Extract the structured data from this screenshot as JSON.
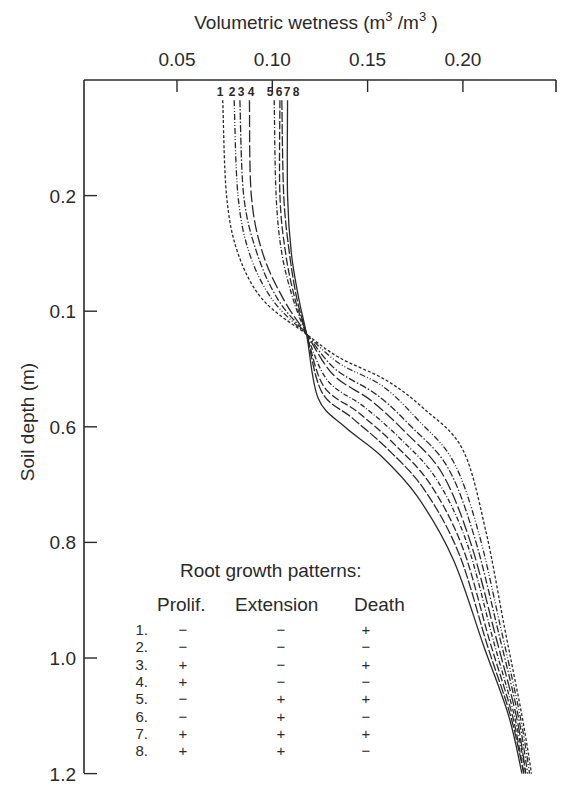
{
  "chart_data": {
    "type": "line",
    "title": "",
    "xlabel": "Volumetric wetness (m³/m³)",
    "ylabel": "Soil depth (m)",
    "x_axis_position": "top",
    "xlim": [
      0.0,
      0.25
    ],
    "ylim": [
      0.0,
      1.2
    ],
    "y_inverted": true,
    "grid": false,
    "x_ticks": [
      0.05,
      0.1,
      0.15,
      0.2
    ],
    "x_tick_labels": [
      "0.05",
      "0.10",
      "0.15",
      "0.20"
    ],
    "y_ticks": [
      0.2,
      0.4,
      0.6,
      0.8,
      1.0,
      1.2
    ],
    "y_tick_labels": [
      "0.2",
      "0.1",
      "0.6",
      "0.8",
      "1.0",
      "1.2"
    ],
    "series": [
      {
        "name": "1",
        "style": "dotted-dash",
        "points": [
          [
            0.074,
            0.035
          ],
          [
            0.076,
            0.2
          ],
          [
            0.082,
            0.3
          ],
          [
            0.095,
            0.38
          ],
          [
            0.118,
            0.44
          ],
          [
            0.135,
            0.48
          ],
          [
            0.16,
            0.52
          ],
          [
            0.18,
            0.57
          ],
          [
            0.2,
            0.64
          ],
          [
            0.212,
            0.78
          ],
          [
            0.222,
            0.95
          ],
          [
            0.231,
            1.1
          ],
          [
            0.236,
            1.2
          ]
        ]
      },
      {
        "name": "2",
        "style": "dash-dot-dot",
        "points": [
          [
            0.08,
            0.035
          ],
          [
            0.082,
            0.2
          ],
          [
            0.088,
            0.3
          ],
          [
            0.1,
            0.38
          ],
          [
            0.118,
            0.44
          ],
          [
            0.135,
            0.49
          ],
          [
            0.158,
            0.53
          ],
          [
            0.177,
            0.59
          ],
          [
            0.195,
            0.66
          ],
          [
            0.208,
            0.78
          ],
          [
            0.22,
            0.95
          ],
          [
            0.23,
            1.1
          ],
          [
            0.235,
            1.2
          ]
        ]
      },
      {
        "name": "3",
        "style": "dash-dot",
        "points": [
          [
            0.083,
            0.035
          ],
          [
            0.085,
            0.2
          ],
          [
            0.092,
            0.3
          ],
          [
            0.103,
            0.38
          ],
          [
            0.118,
            0.44
          ],
          [
            0.133,
            0.5
          ],
          [
            0.155,
            0.545
          ],
          [
            0.173,
            0.6
          ],
          [
            0.192,
            0.67
          ],
          [
            0.206,
            0.79
          ],
          [
            0.219,
            0.96
          ],
          [
            0.229,
            1.1
          ],
          [
            0.234,
            1.2
          ]
        ]
      },
      {
        "name": "4",
        "style": "long-dash",
        "points": [
          [
            0.088,
            0.035
          ],
          [
            0.089,
            0.2
          ],
          [
            0.095,
            0.3
          ],
          [
            0.106,
            0.38
          ],
          [
            0.118,
            0.44
          ],
          [
            0.132,
            0.51
          ],
          [
            0.152,
            0.555
          ],
          [
            0.17,
            0.61
          ],
          [
            0.189,
            0.68
          ],
          [
            0.204,
            0.8
          ],
          [
            0.217,
            0.96
          ],
          [
            0.228,
            1.1
          ],
          [
            0.233,
            1.2
          ]
        ]
      },
      {
        "name": "5",
        "style": "dash-dot-fine",
        "points": [
          [
            0.101,
            0.035
          ],
          [
            0.102,
            0.2
          ],
          [
            0.105,
            0.3
          ],
          [
            0.111,
            0.38
          ],
          [
            0.118,
            0.44
          ],
          [
            0.129,
            0.52
          ],
          [
            0.148,
            0.565
          ],
          [
            0.167,
            0.62
          ],
          [
            0.186,
            0.69
          ],
          [
            0.202,
            0.8
          ],
          [
            0.216,
            0.97
          ],
          [
            0.227,
            1.1
          ],
          [
            0.233,
            1.2
          ]
        ]
      },
      {
        "name": "6",
        "style": "medium-dash",
        "points": [
          [
            0.104,
            0.035
          ],
          [
            0.104,
            0.2
          ],
          [
            0.107,
            0.3
          ],
          [
            0.112,
            0.38
          ],
          [
            0.118,
            0.44
          ],
          [
            0.127,
            0.53
          ],
          [
            0.145,
            0.575
          ],
          [
            0.164,
            0.63
          ],
          [
            0.183,
            0.7
          ],
          [
            0.2,
            0.81
          ],
          [
            0.214,
            0.97
          ],
          [
            0.226,
            1.1
          ],
          [
            0.232,
            1.2
          ]
        ]
      },
      {
        "name": "7",
        "style": "dash-space",
        "points": [
          [
            0.105,
            0.035
          ],
          [
            0.106,
            0.2
          ],
          [
            0.109,
            0.3
          ],
          [
            0.113,
            0.38
          ],
          [
            0.118,
            0.44
          ],
          [
            0.126,
            0.54
          ],
          [
            0.142,
            0.585
          ],
          [
            0.161,
            0.64
          ],
          [
            0.18,
            0.71
          ],
          [
            0.198,
            0.82
          ],
          [
            0.213,
            0.98
          ],
          [
            0.225,
            1.1
          ],
          [
            0.232,
            1.2
          ]
        ]
      },
      {
        "name": "8",
        "style": "solid",
        "points": [
          [
            0.108,
            0.035
          ],
          [
            0.108,
            0.2
          ],
          [
            0.11,
            0.3
          ],
          [
            0.114,
            0.38
          ],
          [
            0.118,
            0.44
          ],
          [
            0.124,
            0.55
          ],
          [
            0.138,
            0.6
          ],
          [
            0.157,
            0.65
          ],
          [
            0.176,
            0.72
          ],
          [
            0.195,
            0.83
          ],
          [
            0.211,
            0.98
          ],
          [
            0.224,
            1.1
          ],
          [
            0.231,
            1.2
          ]
        ]
      }
    ],
    "annotations": [
      "1",
      "2",
      "3",
      "4",
      "5",
      "6",
      "7",
      "8"
    ],
    "legend": {
      "title": "Root growth patterns:",
      "columns": [
        "Prolif.",
        "Extension",
        "Death"
      ],
      "rows": [
        {
          "id": "1.",
          "prolif": "−",
          "extension": "−",
          "death": "+"
        },
        {
          "id": "2.",
          "prolif": "−",
          "extension": "−",
          "death": "−"
        },
        {
          "id": "3.",
          "prolif": "+",
          "extension": "−",
          "death": "+"
        },
        {
          "id": "4.",
          "prolif": "+",
          "extension": "−",
          "death": "−"
        },
        {
          "id": "5.",
          "prolif": "−",
          "extension": "+",
          "death": "+"
        },
        {
          "id": "6.",
          "prolif": "−",
          "extension": "+",
          "death": "−"
        },
        {
          "id": "7.",
          "prolif": "+",
          "extension": "+",
          "death": "+"
        },
        {
          "id": "8.",
          "prolif": "+",
          "extension": "+",
          "death": "−"
        }
      ],
      "position": "lower-left inside plot"
    }
  },
  "labels": {
    "x_title_main": "Volumetric wetness (m",
    "x_title_sup1": "3",
    "x_title_mid": " /m",
    "x_title_sup2": "3",
    "x_title_end": " )",
    "y_title": "Soil depth (m)"
  },
  "colors": {
    "ink": "#2a2a2a",
    "background": "#ffffff"
  }
}
